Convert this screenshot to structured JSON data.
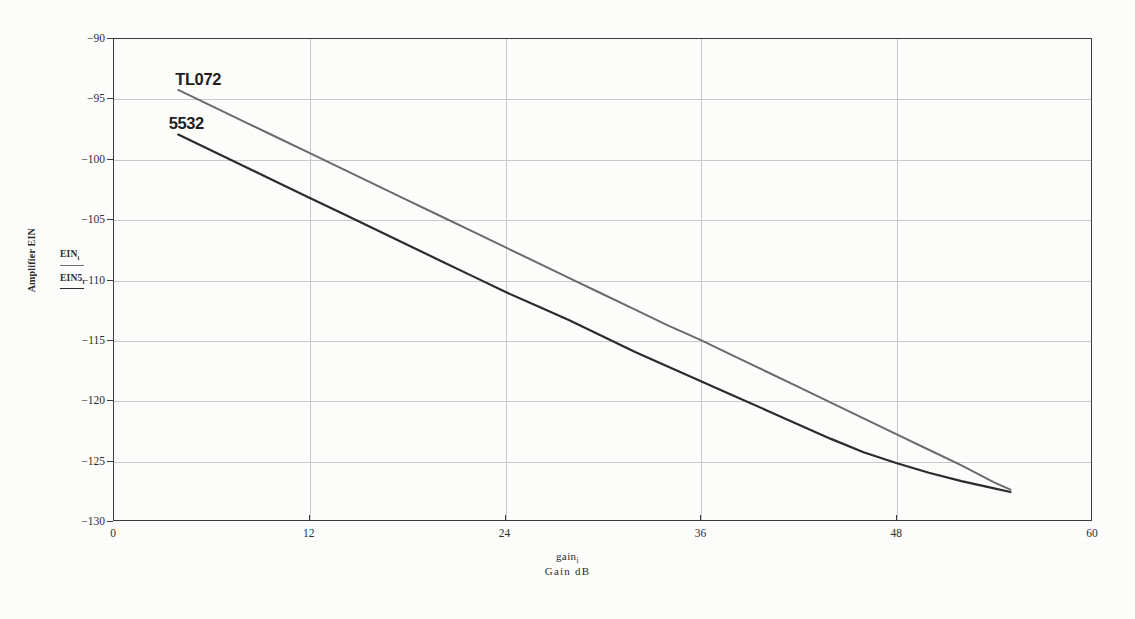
{
  "chart_data": {
    "type": "line",
    "title": "",
    "xlabel": "Gain  dB",
    "xlabel_expr": "gain",
    "xlabel_expr_sub": "i",
    "ylabel": "Amplifier EIN",
    "xlim": [
      0,
      60
    ],
    "ylim": [
      -130,
      -90
    ],
    "xticks": [
      0,
      12,
      24,
      36,
      48,
      60
    ],
    "yticks": [
      -90,
      -95,
      -100,
      -105,
      -110,
      -115,
      -120,
      -125,
      -130
    ],
    "xtick_labels": [
      "0",
      "12",
      "24",
      "36",
      "48",
      "60"
    ],
    "ytick_labels": [
      "-90",
      "-95",
      "-100",
      "-105",
      "-110",
      "-115",
      "-120",
      "-125",
      "-130"
    ],
    "grid": true,
    "legend_position": "outside-left",
    "series": [
      {
        "name": "EIN",
        "name_sub": "i",
        "callout": "TL072",
        "color": "#6b6b6b",
        "x": [
          4,
          6,
          8,
          10,
          12,
          14,
          16,
          18,
          20,
          22,
          24,
          26,
          28,
          30,
          32,
          34,
          36,
          38,
          40,
          42,
          44,
          46,
          48,
          50,
          52,
          54,
          55
        ],
        "y": [
          -94.3,
          -95.6,
          -96.9,
          -98.2,
          -99.5,
          -100.8,
          -102.1,
          -103.4,
          -104.7,
          -106.0,
          -107.3,
          -108.6,
          -109.9,
          -111.2,
          -112.5,
          -113.8,
          -115.0,
          -116.3,
          -117.6,
          -118.9,
          -120.2,
          -121.5,
          -122.8,
          -124.1,
          -125.4,
          -126.8,
          -127.4
        ]
      },
      {
        "name": "EIN5",
        "name_sub": "i",
        "callout": "5532",
        "color": "#2b2b2b",
        "x": [
          4,
          6,
          8,
          10,
          12,
          14,
          16,
          18,
          20,
          22,
          24,
          26,
          28,
          30,
          32,
          34,
          36,
          38,
          40,
          42,
          44,
          46,
          48,
          50,
          52,
          54,
          55
        ],
        "y": [
          -98.0,
          -99.3,
          -100.6,
          -101.9,
          -103.2,
          -104.5,
          -105.8,
          -107.1,
          -108.4,
          -109.7,
          -111.0,
          -112.2,
          -113.4,
          -114.7,
          -116.0,
          -117.2,
          -118.4,
          -119.6,
          -120.8,
          -122.0,
          -123.2,
          -124.3,
          -125.2,
          -126.0,
          -126.7,
          -127.3,
          -127.6
        ]
      }
    ],
    "annotations": [
      {
        "text": "TL072",
        "x": 4.0,
        "y": -94.0
      },
      {
        "text": "5532",
        "x": 3.6,
        "y": -97.6
      }
    ],
    "colors": {
      "frame": "#3b3b3b",
      "grid": "#c9c9c9",
      "background": "#fdfdfc",
      "series_1": "#6b6b6b",
      "series_2": "#2b2b2b"
    }
  }
}
